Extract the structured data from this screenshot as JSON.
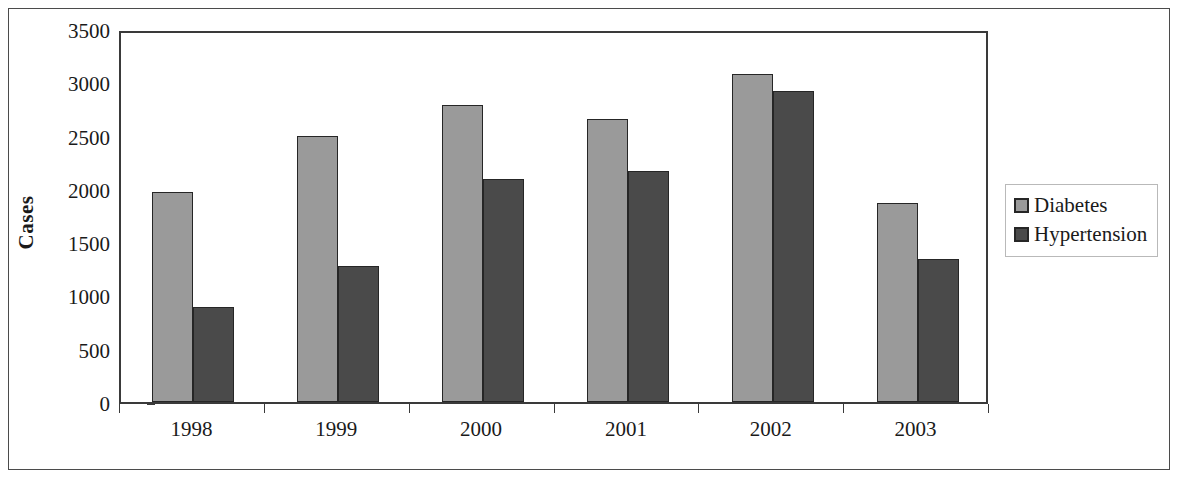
{
  "chart_data": {
    "type": "bar",
    "title": "",
    "subtitle": "",
    "xlabel": "",
    "ylabel": "Cases",
    "categories": [
      "1998",
      "1999",
      "2000",
      "2001",
      "2002",
      "2003"
    ],
    "series": [
      {
        "name": "Diabetes",
        "color": "#9a9a9a",
        "values": [
          1970,
          2500,
          2790,
          2655,
          3075,
          1870
        ]
      },
      {
        "name": "Hypertension",
        "color": "#4a4a4a",
        "values": [
          890,
          1280,
          2095,
          2170,
          2915,
          1345
        ]
      }
    ],
    "ylim": [
      0,
      3500
    ],
    "yticks": [
      0,
      500,
      1000,
      1500,
      2000,
      2500,
      3000,
      3500
    ],
    "ytick_labels": [
      "0",
      "500",
      "1000",
      "1500",
      "2000",
      "2500",
      "3000",
      "3500"
    ],
    "grid": false,
    "legend_position": "right",
    "legend_entries": [
      "Diabetes",
      "Hypertension"
    ],
    "bar_border_color": "#262626",
    "axis_color": "#3a3a3a",
    "background": "#ffffff"
  }
}
